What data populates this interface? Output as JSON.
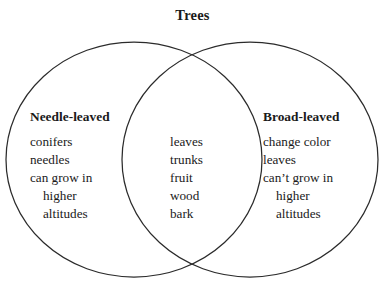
{
  "diagram": {
    "title": "Trees",
    "type": "venn-2-set",
    "colors": {
      "stroke": "#2b2b2b",
      "text": "#1a1a1a",
      "background": "#ffffff"
    },
    "left_set": {
      "heading": "Needle-leaved",
      "items": [
        {
          "text": "conifers",
          "indent": false
        },
        {
          "text": "needles",
          "indent": false
        },
        {
          "text": "can grow in",
          "indent": false
        },
        {
          "text": "higher",
          "indent": true
        },
        {
          "text": "altitudes",
          "indent": true
        }
      ]
    },
    "intersection": {
      "items": [
        {
          "text": "leaves",
          "indent": false
        },
        {
          "text": "trunks",
          "indent": false
        },
        {
          "text": "fruit",
          "indent": false
        },
        {
          "text": "wood",
          "indent": false
        },
        {
          "text": "bark",
          "indent": false
        }
      ]
    },
    "right_set": {
      "heading": "Broad-leaved",
      "items": [
        {
          "text": "change color",
          "indent": false
        },
        {
          "text": "leaves",
          "indent": false
        },
        {
          "text": "can’t grow in",
          "indent": false
        },
        {
          "text": "higher",
          "indent": true
        },
        {
          "text": "altitudes",
          "indent": true
        }
      ]
    }
  }
}
